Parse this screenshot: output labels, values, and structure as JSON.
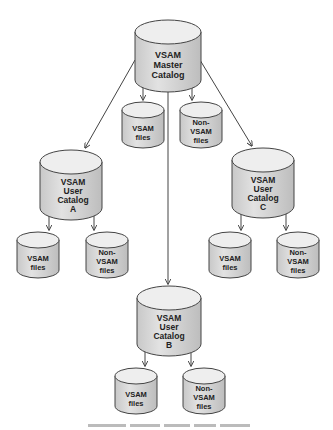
{
  "diagram": {
    "colors": {
      "cylinder_top": "#eeeeee",
      "cylinder_body": "#d9d9d9",
      "cylinder_stroke": "#444444",
      "line": "#444444",
      "text": "#222222"
    },
    "master": {
      "lines": [
        "VSAM",
        "Master",
        "Catalog"
      ]
    },
    "master_files": {
      "vsam": {
        "lines": [
          "VSAM",
          "files"
        ]
      },
      "nonvsam": {
        "lines": [
          "Non-",
          "VSAM",
          "files"
        ]
      }
    },
    "catalog_a": {
      "lines": [
        "VSAM",
        "User",
        "Catalog",
        "A"
      ],
      "vsam": {
        "lines": [
          "VSAM",
          "files"
        ]
      },
      "nonvsam": {
        "lines": [
          "Non-",
          "VSAM",
          "files"
        ]
      }
    },
    "catalog_b": {
      "lines": [
        "VSAM",
        "User",
        "Catalog",
        "B"
      ],
      "vsam": {
        "lines": [
          "VSAM",
          "files"
        ]
      },
      "nonvsam": {
        "lines": [
          "Non-",
          "VSAM",
          "files"
        ]
      }
    },
    "catalog_c": {
      "lines": [
        "VSAM",
        "User",
        "Catalog",
        "C"
      ],
      "vsam": {
        "lines": [
          "VSAM",
          "files"
        ]
      },
      "nonvsam": {
        "lines": [
          "Non-",
          "VSAM",
          "files"
        ]
      }
    }
  }
}
